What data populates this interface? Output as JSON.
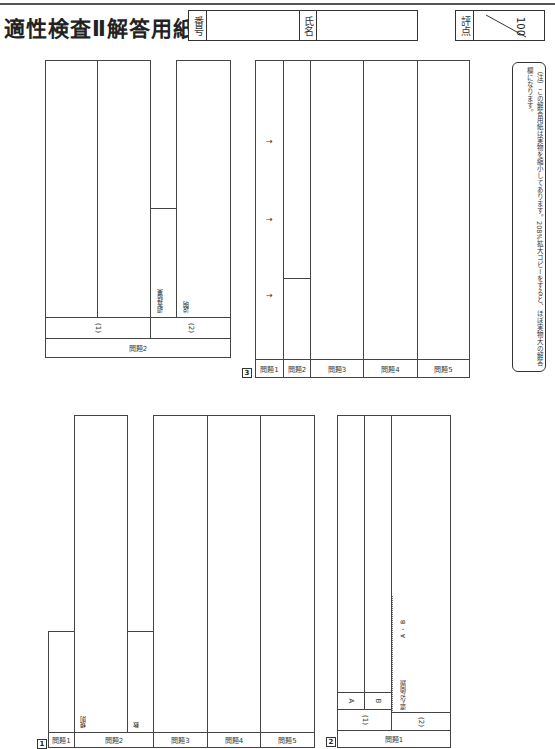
{
  "header": {
    "title": "適性検査Ⅱ解答用紙",
    "number_label": "番号",
    "name_label": "氏名",
    "score_label": "評点",
    "score_total": "100"
  },
  "note": "（注）この解答用紙は実物を縮小してあります。208%拡大コピーをすると、ほぼ実物大の解答欄になります。",
  "section1": {
    "marker": "1",
    "questions": [
      {
        "label": "問題1"
      },
      {
        "label": "問題2",
        "sub": [
          "規則",
          "数"
        ]
      },
      {
        "label": "問題3"
      },
      {
        "label": "問題4"
      },
      {
        "label": "問題5"
      }
    ]
  },
  "section1_q2": {
    "label": "問題2",
    "parts": [
      {
        "label": "(1)"
      },
      {
        "label": "(2)",
        "sub": [
          "調査結果",
          "説明"
        ]
      }
    ]
  },
  "section2": {
    "marker": "2",
    "question_label": "問題1",
    "part1_label": "(1)",
    "part1_rows": [
      "A",
      "B"
    ],
    "part2_label": "(2)",
    "chosen_label": "選んだ問題",
    "chosen_options": "A ・ B"
  },
  "section3": {
    "marker": "3",
    "questions": [
      "問題1",
      "問題2",
      "問題3",
      "問題4",
      "問題5"
    ],
    "arrows": [
      "→",
      "→",
      "→"
    ]
  }
}
